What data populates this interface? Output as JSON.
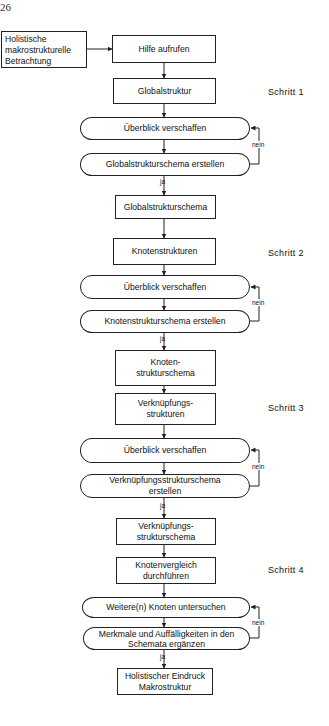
{
  "page_number": "26",
  "nodes": {
    "start": "Holistische\nmakrostrukturelle\nBetrachtung",
    "hilfe": "Hilfe aufrufen",
    "global": "Globalstruktur",
    "ueberblick1": "Überblick verschaffen",
    "global_erstellen": "Globalstrukturschema erstellen",
    "global_schema": "Globalstrukturschema",
    "knoten": "Knotenstrukturen",
    "ueberblick2": "Überblick verschaffen",
    "knoten_erstellen": "Knotenstrukturschema erstellen",
    "knoten_schema": "Knoten-\nstrukturschema",
    "verkn": "Verknüpfungs-\nstrukturen",
    "ueberblick3": "Überblick verschaffen",
    "verkn_erstellen": "Verknüpfungsstrukturschema\nerstellen",
    "verkn_schema": "Verknüpfungs-\nstrukturschema",
    "vergleich": "Knotenvergleich\ndurchführen",
    "weitere": "Weitere(n) Knoten untersuchen",
    "merkmale": "Merkmale und Auffälligkeiten in den\nSchemata ergänzen",
    "ende": "Holistischer Eindruck\nMakrostruktur"
  },
  "steps": [
    "Schritt 1",
    "Schritt 2",
    "Schritt 3",
    "Schritt 4"
  ],
  "labels": {
    "yes": "ja",
    "no": "nein"
  }
}
